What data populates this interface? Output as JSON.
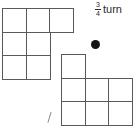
{
  "figure": {
    "title": "",
    "background_color": "#ffffff",
    "line_color": "#555a5e",
    "dot_color": "#161616",
    "text_color": "#2b2b2b"
  },
  "label": {
    "fraction_numerator": "3",
    "fraction_denominator": "4",
    "word": "turn",
    "full_text": "3/4 turn"
  },
  "pivot": {
    "name": "rotation-point",
    "x": 95,
    "y": 44,
    "diameter": 9
  },
  "tick": {
    "name": "diagonal-tick-mark",
    "x": 50,
    "y": 118
  },
  "shapes": [
    {
      "id": "shape-left",
      "label": "original-polyomino",
      "cell_size": 25,
      "origin": {
        "x": 2,
        "y": 8
      },
      "cells": [
        {
          "col": 0,
          "row": 0
        },
        {
          "col": 1,
          "row": 0
        },
        {
          "col": 2,
          "row": 0
        },
        {
          "col": 0,
          "row": 1
        },
        {
          "col": 1,
          "row": 1
        },
        {
          "col": 0,
          "row": 2
        },
        {
          "col": 1,
          "row": 2
        }
      ]
    },
    {
      "id": "shape-right",
      "label": "rotated-polyomino",
      "cell_size": 25,
      "origin": {
        "x": 61,
        "y": 54
      },
      "cells": [
        {
          "col": 0,
          "row": 0
        },
        {
          "col": 0,
          "row": 1
        },
        {
          "col": 1,
          "row": 1
        },
        {
          "col": 2,
          "row": 1
        },
        {
          "col": 0,
          "row": 2
        },
        {
          "col": 1,
          "row": 2
        },
        {
          "col": 2,
          "row": 2
        }
      ]
    }
  ]
}
